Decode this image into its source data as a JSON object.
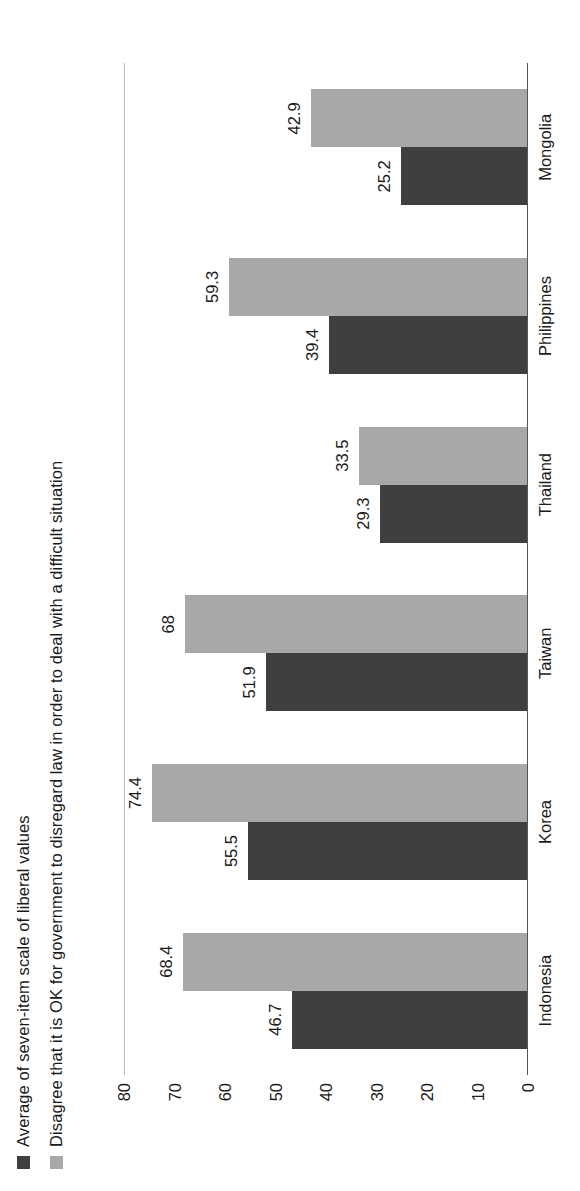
{
  "chart_data": {
    "type": "bar",
    "title": "",
    "xlabel": "",
    "ylabel": "",
    "ylim": [
      0,
      80
    ],
    "yticks": [
      80,
      70,
      60,
      50,
      40,
      30,
      20,
      10,
      0
    ],
    "grid": false,
    "orientation": "vertical-rotated-90",
    "legend_position": "top-left",
    "categories": [
      "Indonesia",
      "Korea",
      "Taiwan",
      "Thailand",
      "Philippines",
      "Mongolia"
    ],
    "series": [
      {
        "name": "Average of seven-item scale of liberal values",
        "color": "#3f3f3f",
        "values": [
          46.7,
          55.5,
          51.9,
          29.3,
          39.4,
          25.2
        ],
        "labels": [
          "46.7",
          "55.5",
          "51.9",
          "29.3",
          "39.4",
          "25.2"
        ]
      },
      {
        "name": "Disagree that it is OK for government to disregard law in order to deal with a difficult situation",
        "color": "#a8a8a8",
        "values": [
          68.4,
          74.4,
          68.0,
          33.5,
          59.3,
          42.9
        ],
        "labels": [
          "68.4",
          "74.4",
          "68",
          "33.5",
          "59.3",
          "42.9"
        ]
      }
    ]
  },
  "legend": {
    "items": [
      {
        "label": "Average of seven-item scale of liberal values",
        "swatch": "dark-square-icon"
      },
      {
        "label": "Disagree that it is OK for government to disregard law in order to deal with a difficult situation",
        "swatch": "light-square-icon"
      }
    ]
  }
}
